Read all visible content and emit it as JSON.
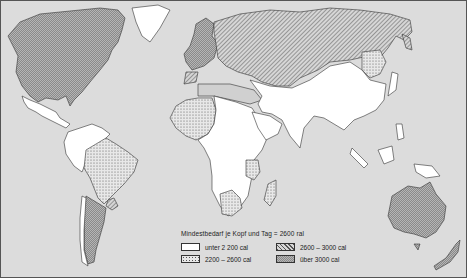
{
  "map": {
    "title": "Mindestbedarf je Kopf und Tag = 2600 cal",
    "title_display": "Mindestbedarf je Kopf und Tag = 2600 ral",
    "colors": {
      "ocean": "#dcdcdc",
      "land_low": "#ffffff",
      "outline": "#333333"
    },
    "legend": {
      "title": "Mindestbedarf je Kopf und Tag  =  2600 ral",
      "items": [
        {
          "label": "unter 2 200 cal",
          "pattern": "white"
        },
        {
          "label": "2600 – 3000 cal",
          "pattern": "diagonal-hatch"
        },
        {
          "label": "2200 – 2600 cal",
          "pattern": "dots"
        },
        {
          "label": "über 3000 cal",
          "pattern": "crosshatch"
        }
      ]
    },
    "regions": [
      {
        "name": "North America",
        "category": "über 3000 cal"
      },
      {
        "name": "Central America",
        "category": "unter 2 200 cal"
      },
      {
        "name": "Greenland",
        "category": "unter 2 200 cal"
      },
      {
        "name": "South America north",
        "category": "unter 2 200 cal"
      },
      {
        "name": "Brazil",
        "category": "2200 – 2600 cal"
      },
      {
        "name": "Argentina",
        "category": "über 3000 cal"
      },
      {
        "name": "Uruguay",
        "category": "2600 – 3000 cal"
      },
      {
        "name": "Western Europe",
        "category": "über 3000 cal"
      },
      {
        "name": "Soviet Union",
        "category": "2600 – 3000 cal"
      },
      {
        "name": "Iberia",
        "category": "2600 – 3000 cal"
      },
      {
        "name": "West Africa",
        "category": "2200 – 2600 cal"
      },
      {
        "name": "Africa",
        "category": "unter 2 200 cal"
      },
      {
        "name": "South Africa",
        "category": "2200 – 2600 cal"
      },
      {
        "name": "East Africa",
        "category": "2200 – 2600 cal"
      },
      {
        "name": "Madagascar",
        "category": "2200 – 2600 cal"
      },
      {
        "name": "Asia",
        "category": "unter 2 200 cal"
      },
      {
        "name": "Manchuria",
        "category": "2200 – 2600 cal"
      },
      {
        "name": "Kamchatka",
        "category": "2600 – 3000 cal"
      },
      {
        "name": "Australia",
        "category": "über 3000 cal"
      },
      {
        "name": "New Zealand",
        "category": "über 3000 cal"
      }
    ]
  }
}
